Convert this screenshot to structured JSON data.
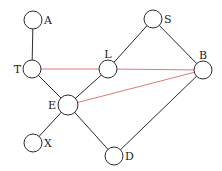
{
  "diagram": {
    "type": "graph",
    "colors": {
      "edge": "#2b2b2b",
      "highlight_edge": "#e07a7a",
      "node_fill": "#ffffff"
    },
    "nodes": [
      {
        "id": "A",
        "label": "A",
        "x": 33,
        "y": 20,
        "r": 9,
        "label_pos": "right"
      },
      {
        "id": "T",
        "label": "T",
        "x": 32,
        "y": 69,
        "r": 9,
        "label_pos": "left"
      },
      {
        "id": "L",
        "label": "L",
        "x": 108,
        "y": 69,
        "r": 9,
        "label_pos": "top"
      },
      {
        "id": "S",
        "label": "S",
        "x": 153,
        "y": 19,
        "r": 9,
        "label_pos": "right"
      },
      {
        "id": "B",
        "label": "B",
        "x": 203,
        "y": 70,
        "r": 9,
        "label_pos": "top"
      },
      {
        "id": "E",
        "label": "E",
        "x": 68,
        "y": 105,
        "r": 10,
        "label_pos": "left"
      },
      {
        "id": "X",
        "label": "X",
        "x": 33,
        "y": 143,
        "r": 9,
        "label_pos": "right"
      },
      {
        "id": "D",
        "label": "D",
        "x": 114,
        "y": 156,
        "r": 9,
        "label_pos": "right"
      }
    ],
    "edges": [
      {
        "from": "A",
        "to": "T",
        "color": "black"
      },
      {
        "from": "T",
        "to": "E",
        "color": "black"
      },
      {
        "from": "E",
        "to": "L",
        "color": "black"
      },
      {
        "from": "L",
        "to": "S",
        "color": "black"
      },
      {
        "from": "S",
        "to": "B",
        "color": "black"
      },
      {
        "from": "E",
        "to": "X",
        "color": "black"
      },
      {
        "from": "E",
        "to": "D",
        "color": "black"
      },
      {
        "from": "B",
        "to": "D",
        "color": "black"
      },
      {
        "from": "T",
        "to": "L",
        "color": "red"
      },
      {
        "from": "L",
        "to": "B",
        "color": "red"
      },
      {
        "from": "E",
        "to": "B",
        "color": "red"
      }
    ]
  }
}
